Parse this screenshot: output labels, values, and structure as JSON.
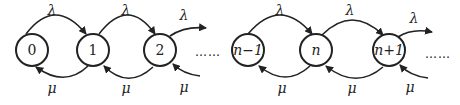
{
  "diagram": {
    "type": "birth-death-process",
    "nodes": [
      {
        "id": "0",
        "label": "0",
        "cx": 32,
        "cy": 50
      },
      {
        "id": "1",
        "label": "1",
        "cx": 93,
        "cy": 50
      },
      {
        "id": "2",
        "label": "2",
        "cx": 160,
        "cy": 50
      },
      {
        "id": "n-1",
        "label": "n−1",
        "cx": 248,
        "cy": 50
      },
      {
        "id": "n",
        "label": "n",
        "cx": 316,
        "cy": 50
      },
      {
        "id": "n+1",
        "label": "n+1",
        "cx": 389,
        "cy": 50
      }
    ],
    "arrival_rate_label": "λ",
    "service_rate_label": "μ",
    "ellipsis": "……",
    "ellipsis_end": "……"
  }
}
